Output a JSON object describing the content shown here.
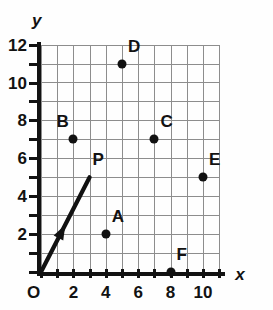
{
  "figure": {
    "background_color": "#ffffff",
    "axis_color": "#121212",
    "grid_color": "#8d8d8d",
    "point_color": "#111111"
  },
  "axes": {
    "x_name": "x",
    "y_name": "y",
    "origin_label": "O",
    "x_min": 0,
    "x_max": 11,
    "y_min": 0,
    "y_max": 12,
    "x_tick_step": 1,
    "y_tick_step": 1,
    "x_labels": [
      "2",
      "4",
      "6",
      "8",
      "10"
    ],
    "x_label_values": [
      2,
      4,
      6,
      8,
      10
    ],
    "y_labels": [
      "2",
      "4",
      "6",
      "8",
      "10",
      "12"
    ],
    "y_label_values": [
      2,
      4,
      6,
      8,
      10,
      12
    ],
    "grid": "on"
  },
  "chart_data": {
    "type": "scatter",
    "title": "",
    "xlabel": "x",
    "ylabel": "y",
    "xlim": [
      0,
      11
    ],
    "ylim": [
      0,
      12
    ],
    "grid": true,
    "legend": "none",
    "points": [
      {
        "label": "A",
        "x": 4,
        "y": 2,
        "label_position": "above-right"
      },
      {
        "label": "B",
        "x": 2,
        "y": 7,
        "label_position": "above-left"
      },
      {
        "label": "C",
        "x": 7,
        "y": 7,
        "label_position": "above-right"
      },
      {
        "label": "D",
        "x": 5,
        "y": 11,
        "label_position": "above-right"
      },
      {
        "label": "E",
        "x": 10,
        "y": 5,
        "label_position": "above-right"
      },
      {
        "label": "F",
        "x": 8,
        "y": 0,
        "label_position": "above-right"
      }
    ],
    "vectors": [
      {
        "label": "P",
        "from_x": 0,
        "from_y": 0,
        "to_x": 3,
        "to_y": 5,
        "arrowhead": "mid-line",
        "label_position": "above-right",
        "color": "#111111"
      }
    ]
  }
}
